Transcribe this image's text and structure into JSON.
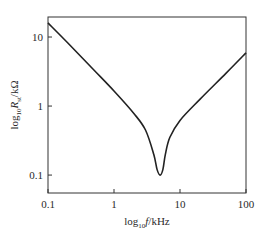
{
  "chart_data": {
    "type": "line",
    "title": "",
    "xlabel": "log10 f/kHz",
    "ylabel": "log10 R_st/kΩ",
    "xscale": "log",
    "yscale": "log",
    "xlim": [
      0.1,
      100
    ],
    "ylim": [
      0.055,
      19.5
    ],
    "grid": false,
    "legend": null,
    "x_ticks": [
      0.1,
      1,
      10,
      100
    ],
    "x_tick_labels": [
      "0.1",
      "1",
      "10",
      "100"
    ],
    "y_ticks": [
      0.1,
      1,
      10
    ],
    "y_tick_labels": [
      "0.1",
      "1",
      "10"
    ],
    "series": [
      {
        "name": "R",
        "color": "#222222",
        "x": [
          0.1,
          0.2,
          0.5,
          1.0,
          2.0,
          3.0,
          4.0,
          4.5,
          5.0,
          5.5,
          6.0,
          7.0,
          10.0,
          20.0,
          50.0,
          100.0
        ],
        "y": [
          16.0,
          8.2,
          3.3,
          1.65,
          0.78,
          0.45,
          0.2,
          0.12,
          0.1,
          0.12,
          0.2,
          0.35,
          0.62,
          1.25,
          3.0,
          5.9
        ]
      }
    ],
    "annotations": []
  },
  "labels": {
    "xlabel_main": "log",
    "xlabel_sub": "10",
    "xlabel_rest": "f/kHz",
    "ylabel_main": "log",
    "ylabel_sub": "10",
    "ylabel_R": "R",
    "ylabel_R_sub": "st",
    "ylabel_rest": "/kΩ"
  }
}
